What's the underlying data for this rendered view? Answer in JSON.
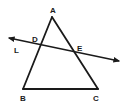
{
  "diagram": {
    "type": "geometry-triangle-with-transversal",
    "stroke_color": "#1a1a1a",
    "background": "#ffffff",
    "vertices": {
      "A": {
        "label": "A",
        "x": 52,
        "y": 17,
        "label_x": 50,
        "label_y": 13
      },
      "B": {
        "label": "B",
        "x": 23,
        "y": 89,
        "label_x": 20,
        "label_y": 101
      },
      "C": {
        "label": "C",
        "x": 98,
        "y": 89,
        "label_x": 93,
        "label_y": 101
      }
    },
    "points": {
      "D": {
        "label": "D",
        "x": 40,
        "y": 45,
        "label_x": 32,
        "label_y": 42
      },
      "E": {
        "label": "E",
        "x": 74,
        "y": 52,
        "label_x": 77,
        "label_y": 51
      }
    },
    "line": {
      "label": "L",
      "x1": 9,
      "y1": 38,
      "x2": 119,
      "y2": 61,
      "label_x": 14,
      "label_y": 53,
      "arrows": "both"
    },
    "segments": [
      "AB",
      "AC",
      "BC"
    ]
  }
}
